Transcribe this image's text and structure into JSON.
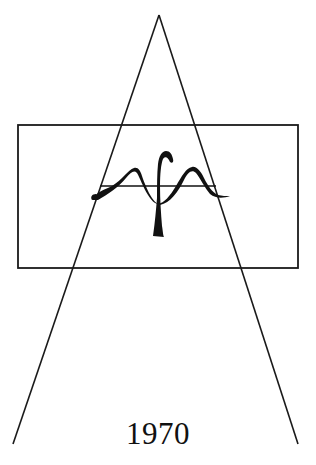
{
  "emblem": {
    "year": "1970",
    "colors": {
      "stroke": "#1a1a1a",
      "background": "#ffffff",
      "text": "#111111"
    },
    "shapes": {
      "triangle": {
        "apex": [
          159,
          15
        ],
        "base_left": [
          13,
          444
        ],
        "base_right": [
          298,
          444
        ]
      },
      "rectangle": {
        "x": 18,
        "y": 125,
        "width": 280,
        "height": 143
      },
      "symbol": "calligraphic-monogram-wave-with-central-stem"
    }
  }
}
